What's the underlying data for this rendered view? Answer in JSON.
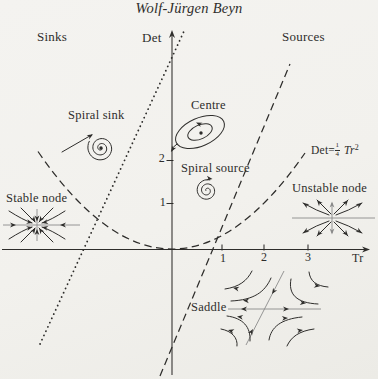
{
  "page": {
    "header": "Wolf-Jürgen Beyn"
  },
  "colors": {
    "background": "#f2f1ed",
    "ink": "#2e2d2b",
    "gray": "#8a8a8a"
  },
  "regions": {
    "sinks": "Sinks",
    "det": "Det",
    "sources": "Sources"
  },
  "labels": {
    "spiral_sink": "Spiral sink",
    "centre": "Centre",
    "spiral_source": "Spiral source",
    "stable_node": "Stable node",
    "unstable_node": "Unstable node",
    "saddle": "Saddle"
  },
  "formula": {
    "prefix": "Det=",
    "num": "1",
    "den": "4",
    "variable": "Tr",
    "exponent": "2"
  },
  "axes": {
    "tr_label": "Tr",
    "tr_ticks": [
      "1",
      "2",
      "3"
    ],
    "det_ticks": [
      "1",
      "2"
    ]
  }
}
